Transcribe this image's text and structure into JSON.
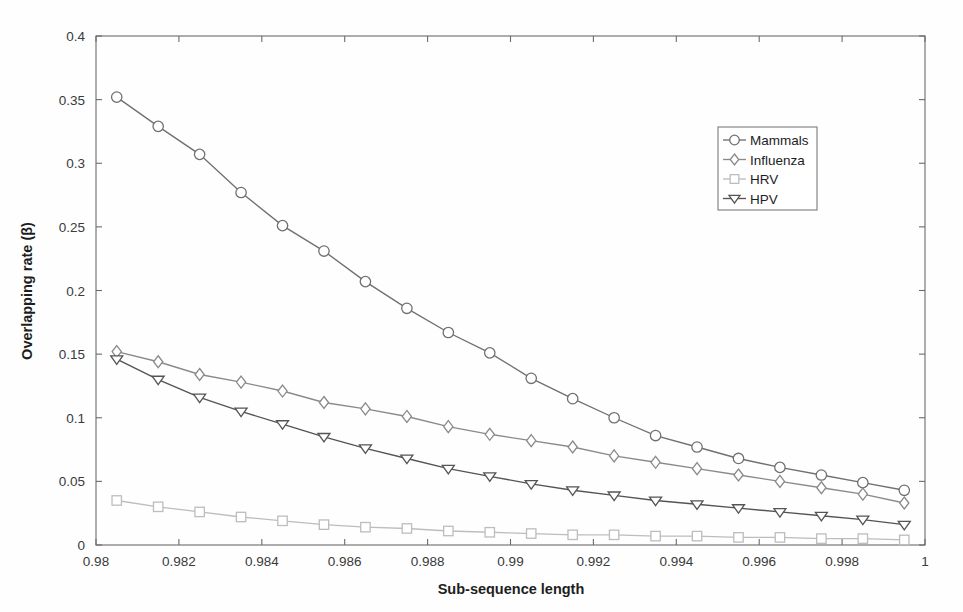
{
  "chart_data": {
    "type": "line",
    "title": "",
    "xlabel": "Sub-sequence length",
    "ylabel": "Overlapping rate (β)",
    "xlim": [
      0.98,
      1.0
    ],
    "ylim": [
      0.0,
      0.4
    ],
    "xticks": [
      0.98,
      0.982,
      0.984,
      0.986,
      0.988,
      0.99,
      0.992,
      0.994,
      0.996,
      0.998,
      1
    ],
    "xtick_labels": [
      "0.98",
      "0.982",
      "0.984",
      "0.986",
      "0.988",
      "0.99",
      "0.992",
      "0.994",
      "0.996",
      "0.998",
      "1"
    ],
    "yticks": [
      0,
      0.05,
      0.1,
      0.15,
      0.2,
      0.25,
      0.3,
      0.35,
      0.4
    ],
    "ytick_labels": [
      "0",
      "0.05",
      "0.1",
      "0.15",
      "0.2",
      "0.25",
      "0.3",
      "0.35",
      "0.4"
    ],
    "grid": false,
    "legend_position": "upper right",
    "x": [
      0.9805,
      0.9815,
      0.9825,
      0.9835,
      0.9845,
      0.9855,
      0.9865,
      0.9875,
      0.9885,
      0.9895,
      0.9905,
      0.9915,
      0.9925,
      0.9935,
      0.9945,
      0.9955,
      0.9965,
      0.9975,
      0.9985,
      0.9995
    ],
    "series": [
      {
        "name": "Mammals",
        "marker": "circle",
        "color": "#707070",
        "values": [
          0.352,
          0.329,
          0.307,
          0.277,
          0.251,
          0.231,
          0.207,
          0.186,
          0.167,
          0.151,
          0.131,
          0.115,
          0.1,
          0.086,
          0.077,
          0.068,
          0.061,
          0.055,
          0.049,
          0.043
        ]
      },
      {
        "name": "Influenza",
        "marker": "diamond",
        "color": "#8a8a8a",
        "values": [
          0.152,
          0.144,
          0.134,
          0.128,
          0.121,
          0.112,
          0.107,
          0.101,
          0.093,
          0.087,
          0.082,
          0.077,
          0.07,
          0.065,
          0.06,
          0.055,
          0.05,
          0.045,
          0.04,
          0.033
        ]
      },
      {
        "name": "HRV",
        "marker": "square",
        "color": "#bdbdbd",
        "values": [
          0.035,
          0.03,
          0.026,
          0.022,
          0.019,
          0.016,
          0.014,
          0.013,
          0.011,
          0.01,
          0.009,
          0.008,
          0.008,
          0.007,
          0.007,
          0.006,
          0.006,
          0.005,
          0.005,
          0.004
        ]
      },
      {
        "name": "HPV",
        "marker": "triangle-down",
        "color": "#545454",
        "values": [
          0.146,
          0.13,
          0.116,
          0.105,
          0.095,
          0.085,
          0.076,
          0.068,
          0.06,
          0.054,
          0.048,
          0.043,
          0.039,
          0.035,
          0.032,
          0.029,
          0.026,
          0.023,
          0.02,
          0.016
        ]
      }
    ]
  },
  "legend": {
    "entries": [
      {
        "label": "Mammals"
      },
      {
        "label": "Influenza"
      },
      {
        "label": "HRV"
      },
      {
        "label": "HPV"
      }
    ]
  }
}
